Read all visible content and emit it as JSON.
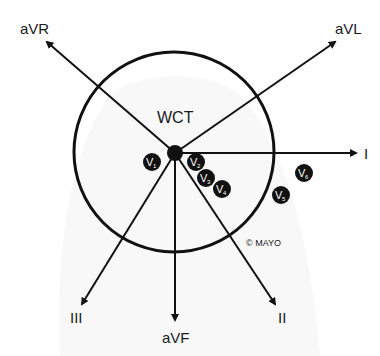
{
  "diagram": {
    "center_label": "WCT",
    "copyright": "© MAYO",
    "colors": {
      "line": "#111111",
      "background": "#ffffff",
      "torso": "#f2f2f2"
    },
    "limb_leads": [
      {
        "id": "aVR",
        "label": "aVR"
      },
      {
        "id": "aVL",
        "label": "aVL"
      },
      {
        "id": "I",
        "label": "I"
      },
      {
        "id": "II",
        "label": "II"
      },
      {
        "id": "aVF",
        "label": "aVF"
      },
      {
        "id": "III",
        "label": "III"
      }
    ],
    "precordial_leads": [
      {
        "id": "V1",
        "letter": "V",
        "sub": "1"
      },
      {
        "id": "V2",
        "letter": "V",
        "sub": "2"
      },
      {
        "id": "V3",
        "letter": "V",
        "sub": "3"
      },
      {
        "id": "V4",
        "letter": "V",
        "sub": "4"
      },
      {
        "id": "V5",
        "letter": "V",
        "sub": "5"
      },
      {
        "id": "V6",
        "letter": "V",
        "sub": "6"
      }
    ]
  }
}
